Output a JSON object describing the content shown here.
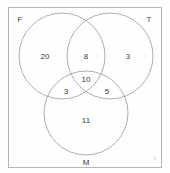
{
  "figure": {
    "universal_set_label": "E",
    "stroke_color": "#9b9b9b",
    "box_stroke_color": "#b5b5b5",
    "text_color": "#3a3a3a",
    "background": "#fefefe"
  },
  "sets": [
    {
      "id": "F",
      "label": "F",
      "label_x": 20,
      "label_y": 20,
      "cx": 62,
      "cy": 56,
      "r": 43
    },
    {
      "id": "T",
      "label": "T",
      "label_x": 149,
      "label_y": 20,
      "cx": 110,
      "cy": 56,
      "r": 43
    },
    {
      "id": "M",
      "label": "M",
      "label_x": 86,
      "label_y": 163,
      "cx": 86,
      "cy": 113,
      "r": 42
    }
  ],
  "regions": [
    {
      "id": "F-only",
      "label": "F only",
      "value": "20",
      "x": 45,
      "y": 57
    },
    {
      "id": "FT-only",
      "label": "F and T only",
      "value": "8",
      "x": 86,
      "y": 57
    },
    {
      "id": "T-only",
      "label": "T only",
      "value": "3",
      "x": 128,
      "y": 57
    },
    {
      "id": "FTM",
      "label": "F, T and M",
      "value": "10",
      "x": 86,
      "y": 80
    },
    {
      "id": "FM-only",
      "label": "F and M only",
      "value": "3",
      "x": 66,
      "y": 92
    },
    {
      "id": "TM-only",
      "label": "T and M only",
      "value": "5",
      "x": 107,
      "y": 92
    },
    {
      "id": "M-only",
      "label": "M only",
      "value": "11",
      "x": 86,
      "y": 121
    }
  ],
  "corner_mark": {
    "text": "E",
    "x": 155,
    "y": 158
  },
  "box": {
    "x": 8,
    "y": 7,
    "width": 154,
    "height": 161
  }
}
